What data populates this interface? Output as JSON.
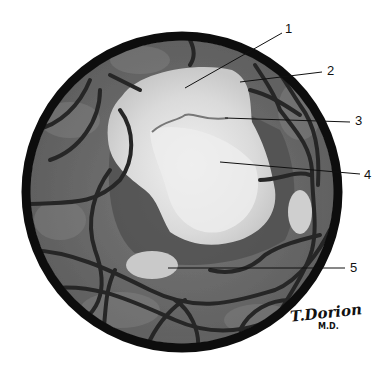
{
  "figure": {
    "colors": {
      "ring": "#0d0d0d",
      "background_fundus": "#6e6e6e",
      "lesion": "#dcdcdc",
      "lesion_core": "#eeeeee",
      "vessels": "#2a2a2a",
      "dark_halo": "#4a4a4a"
    },
    "labels": [
      {
        "id": "1",
        "text": "1"
      },
      {
        "id": "2",
        "text": "2"
      },
      {
        "id": "3",
        "text": "3"
      },
      {
        "id": "4",
        "text": "4"
      },
      {
        "id": "5",
        "text": "5"
      }
    ],
    "signature": {
      "name": "T.Dorion",
      "suffix": "M.D."
    }
  }
}
